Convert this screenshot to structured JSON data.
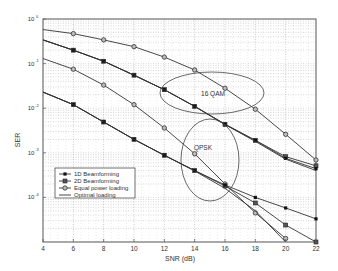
{
  "chart_data": {
    "type": "line",
    "title": "",
    "xlabel": "SNR (dB)",
    "ylabel": "SER",
    "xlim": [
      4,
      22
    ],
    "ylim": [
      1e-05,
      1
    ],
    "yscale": "log",
    "grid": true,
    "x_ticks": [
      4,
      6,
      8,
      10,
      12,
      14,
      16,
      18,
      20,
      22
    ],
    "y_ticks": [
      {
        "value": 1,
        "base": "10",
        "exp": "0"
      },
      {
        "value": 0.1,
        "base": "10",
        "exp": "-1"
      },
      {
        "value": 0.01,
        "base": "10",
        "exp": "-2"
      },
      {
        "value": 0.001,
        "base": "10",
        "exp": "-3"
      },
      {
        "value": 0.0001,
        "base": "10",
        "exp": "-4"
      }
    ],
    "x": [
      4,
      6,
      8,
      10,
      12,
      14,
      16,
      18,
      20,
      22
    ],
    "series": [
      {
        "name": "Equal power loading (16 QAM)",
        "marker": "circle",
        "values": [
          0.58,
          0.47,
          0.34,
          0.24,
          0.14,
          0.072,
          0.028,
          0.0095,
          0.0026,
          0.00069
        ]
      },
      {
        "name": "2D Beamforming (16 QAM)",
        "marker": "square",
        "values": [
          0.34,
          0.2,
          0.113,
          0.055,
          0.026,
          0.011,
          0.0043,
          0.0019,
          0.00082,
          0.00051
        ]
      },
      {
        "name": "1D Beamforming (16 QAM)",
        "marker": "filled",
        "values": [
          0.34,
          0.2,
          0.113,
          0.055,
          0.026,
          0.011,
          0.0044,
          0.0019,
          0.00075,
          0.00044
        ]
      },
      {
        "name": "Optimal loading (16 QAM)",
        "marker": "none",
        "values": [
          0.34,
          0.2,
          0.113,
          0.055,
          0.026,
          0.011,
          0.0043,
          0.0018,
          0.00072,
          0.0004
        ]
      },
      {
        "name": "Equal power loading (QPSK)",
        "marker": "circle",
        "values": [
          0.13,
          0.075,
          0.033,
          0.012,
          0.0036,
          0.00095,
          0.0002,
          4.5e-05,
          1.2e-05,
          null
        ]
      },
      {
        "name": "2D Beamforming (QPSK)",
        "marker": "square",
        "values": [
          0.023,
          0.012,
          0.0049,
          0.002,
          0.00088,
          0.0004,
          0.00018,
          7.5e-05,
          2.4e-05,
          1e-05
        ]
      },
      {
        "name": "1D Beamforming (QPSK)",
        "marker": "filled",
        "values": [
          0.023,
          0.012,
          0.0049,
          0.002,
          0.00088,
          0.0004,
          0.00019,
          0.0001,
          5.8e-05,
          3.3e-05
        ]
      },
      {
        "name": "Optimal loading (QPSK)",
        "marker": "none",
        "values": [
          0.023,
          0.012,
          0.0049,
          0.002,
          0.00088,
          0.00039,
          0.00016,
          5e-05,
          1e-05,
          null
        ]
      }
    ],
    "legend": {
      "position": "lower left",
      "entries": [
        "1D Beamforming",
        "2D Beamforming",
        "Equal power loading",
        "Optimal loading"
      ]
    },
    "annotations": [
      {
        "text": "16 QAM",
        "shape": "ellipse",
        "cx_snr": 15.5,
        "cy_ser": 0.012
      },
      {
        "text": "QPSK",
        "shape": "ellipse",
        "cx_snr": 15.0,
        "cy_ser": 0.0004
      }
    ]
  }
}
